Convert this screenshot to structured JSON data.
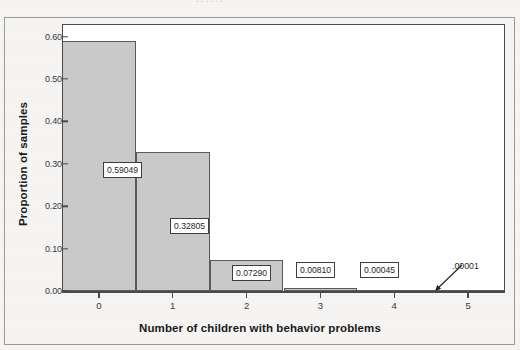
{
  "figure": {
    "header_ghost": "......",
    "background_color": "#f6f5f3",
    "frame_color": "#4a4a4a",
    "bar_fill_color": "#c9c9c9",
    "bar_edge_color": "#5a5a5a"
  },
  "chart_data": {
    "type": "bar",
    "title": "",
    "subtitle": "",
    "xlabel": "Number of children with behavior problems",
    "ylabel": "Proportion of samples",
    "categories": [
      "0",
      "1",
      "2",
      "3",
      "4",
      "5"
    ],
    "values": [
      0.59049,
      0.32805,
      0.0729,
      0.0081,
      0.00045,
      1e-05
    ],
    "value_labels": [
      "0.59049",
      "0.32805",
      "0.07290",
      "0.00810",
      "0.00045",
      ".00001"
    ],
    "ylim": [
      0.0,
      0.63
    ],
    "xlim": [
      -0.5,
      5.5
    ],
    "ytick_labels": [
      "0.00",
      "0.10",
      "0.20",
      "0.30",
      "0.40",
      "0.50",
      "0.60"
    ],
    "ytick_values": [
      0.0,
      0.1,
      0.2,
      0.3,
      0.4,
      0.5,
      0.6
    ],
    "xtick_labels": [
      "0",
      "1",
      "2",
      "3",
      "4",
      "5"
    ],
    "grid": false,
    "legend": false,
    "legend_position": "none",
    "annotations": [
      {
        "text": ".00001",
        "style": "callout-with-leader",
        "points_to_category": "5"
      }
    ]
  }
}
